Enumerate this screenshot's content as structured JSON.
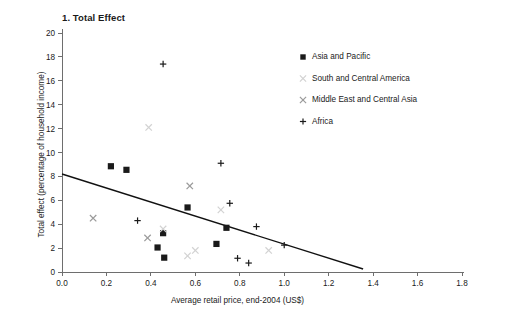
{
  "chart_data": {
    "type": "scatter",
    "title": "1. Total Effect",
    "xlabel": "Average retail price, end-2004 (US$)",
    "ylabel": "Total effect (percentage of household income)",
    "xlim": [
      0.0,
      1.8
    ],
    "ylim": [
      0,
      20
    ],
    "xticks": [
      "0.0",
      "0.2",
      "0.4",
      "0.6",
      "0.8",
      "1.0",
      "1.2",
      "1.4",
      "1.6",
      "1.8"
    ],
    "xtick_values": [
      0.0,
      0.2,
      0.4,
      0.6,
      0.8,
      1.0,
      1.2,
      1.4,
      1.6,
      1.8
    ],
    "yticks": [
      "0",
      "2",
      "4",
      "6",
      "8",
      "10",
      "12",
      "14",
      "16",
      "18",
      "20"
    ],
    "ytick_values": [
      0,
      2,
      4,
      6,
      8,
      10,
      12,
      14,
      16,
      18,
      20
    ],
    "grid": false,
    "legend_position": "upper-right",
    "series": [
      {
        "name": "Asia and Pacific",
        "marker": "square",
        "color": "#1a1a1a",
        "points": [
          {
            "x": 0.22,
            "y": 8.85
          },
          {
            "x": 0.29,
            "y": 8.55
          },
          {
            "x": 0.455,
            "y": 3.25
          },
          {
            "x": 0.43,
            "y": 2.05
          },
          {
            "x": 0.46,
            "y": 1.2
          },
          {
            "x": 0.565,
            "y": 5.4
          },
          {
            "x": 0.695,
            "y": 2.35
          },
          {
            "x": 0.74,
            "y": 3.7
          }
        ]
      },
      {
        "name": "South and Central America",
        "marker": "x",
        "color": "#d2d2d2",
        "points": [
          {
            "x": 0.39,
            "y": 12.1
          },
          {
            "x": 0.455,
            "y": 3.6
          },
          {
            "x": 0.565,
            "y": 1.35
          },
          {
            "x": 0.6,
            "y": 1.8
          },
          {
            "x": 0.715,
            "y": 5.2
          },
          {
            "x": 0.93,
            "y": 1.8
          }
        ]
      },
      {
        "name": "Middle East and Central Asia",
        "marker": "x",
        "color": "#9a9a9a",
        "points": [
          {
            "x": 0.14,
            "y": 4.5
          },
          {
            "x": 0.385,
            "y": 2.85
          },
          {
            "x": 0.575,
            "y": 7.2
          }
        ]
      },
      {
        "name": "Africa",
        "marker": "plus",
        "color": "#1a1a1a",
        "points": [
          {
            "x": 0.455,
            "y": 17.4
          },
          {
            "x": 0.715,
            "y": 9.1
          },
          {
            "x": 0.34,
            "y": 4.3
          },
          {
            "x": 0.755,
            "y": 5.75
          },
          {
            "x": 0.875,
            "y": 3.8
          },
          {
            "x": 0.79,
            "y": 1.15
          },
          {
            "x": 0.84,
            "y": 0.75
          },
          {
            "x": 1.0,
            "y": 2.25
          }
        ]
      }
    ],
    "trendline": {
      "x_start": 0.0,
      "y_start": 8.2,
      "x_end": 1.355,
      "y_end": 0.25
    }
  },
  "legend": {
    "entries": [
      {
        "label": "Asia and Pacific"
      },
      {
        "label": "South and Central America"
      },
      {
        "label": "Middle East and Central Asia"
      },
      {
        "label": "Africa"
      }
    ]
  }
}
